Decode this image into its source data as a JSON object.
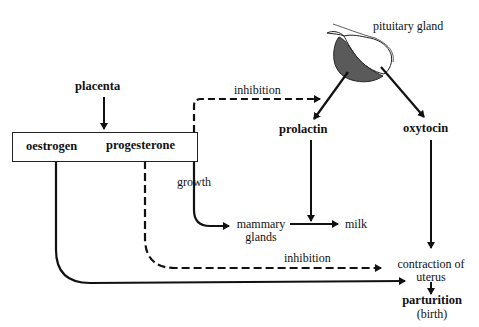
{
  "diagram": {
    "nodes": {
      "placenta": "placenta",
      "oestrogen": "oestrogen",
      "progesterone": "progesterone",
      "pituitary_gland": "pituitary gland",
      "prolactin": "prolactin",
      "oxytocin": "oxytocin",
      "mammary_glands_line1": "mammary",
      "mammary_glands_line2": "glands",
      "milk": "milk",
      "contraction_line1": "contraction of",
      "contraction_line2": "uterus",
      "parturition": "parturition",
      "birth": "(birth)"
    },
    "edge_labels": {
      "inhibition_top": "inhibition",
      "growth": "growth",
      "inhibition_bottom": "inhibition"
    },
    "edges": [
      {
        "from": "placenta",
        "to": "oestrogen/progesterone box",
        "style": "solid"
      },
      {
        "from": "progesterone",
        "to": "pituitary gland",
        "label": "inhibition",
        "style": "dashed"
      },
      {
        "from": "pituitary gland",
        "to": "prolactin",
        "style": "solid"
      },
      {
        "from": "pituitary gland",
        "to": "oxytocin",
        "style": "solid"
      },
      {
        "from": "progesterone",
        "to": "mammary glands",
        "label": "growth",
        "style": "solid"
      },
      {
        "from": "prolactin",
        "to": "mammary glands -> milk",
        "style": "solid"
      },
      {
        "from": "mammary glands",
        "to": "milk",
        "style": "solid"
      },
      {
        "from": "oxytocin",
        "to": "contraction of uterus",
        "style": "solid"
      },
      {
        "from": "progesterone",
        "to": "contraction of uterus",
        "label": "inhibition",
        "style": "dashed"
      },
      {
        "from": "oestrogen",
        "to": "contraction of uterus",
        "style": "solid"
      },
      {
        "from": "contraction of uterus",
        "to": "parturition",
        "style": "solid"
      }
    ],
    "colors": {
      "line": "#111111",
      "pituitary_fill": "#5a5a5a",
      "background": "#ffffff"
    }
  }
}
